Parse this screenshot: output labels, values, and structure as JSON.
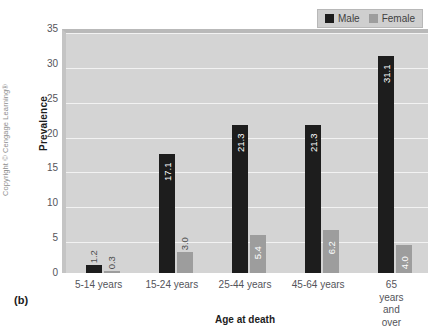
{
  "chart_data": {
    "type": "bar",
    "title": "",
    "xlabel": "Age at death",
    "ylabel": "Prevalence",
    "ylim": [
      0,
      35
    ],
    "yticks": [
      0,
      5,
      10,
      15,
      20,
      25,
      30,
      35
    ],
    "grid": true,
    "legend_position": "top-right",
    "categories": [
      "5-14 years",
      "15-24 years",
      "25-44 years",
      "45-64 years",
      "65 years\nand over"
    ],
    "series": [
      {
        "name": "Male",
        "color": "#1d1d1d",
        "values": [
          1.2,
          17.1,
          21.3,
          21.3,
          31.1
        ]
      },
      {
        "name": "Female",
        "color": "#9d9d9d",
        "values": [
          0.3,
          3.0,
          5.4,
          6.2,
          4.0
        ]
      }
    ]
  },
  "legend": {
    "entries": [
      {
        "label": "Male",
        "swatch": "black-square-swatch"
      },
      {
        "label": "Female",
        "swatch": "gray-square-swatch"
      }
    ]
  },
  "axes": {
    "y_title": "Prevalence",
    "x_title": "Age at death",
    "y_tick_labels": [
      "0",
      "5",
      "10",
      "15",
      "20",
      "25",
      "30",
      "35"
    ],
    "x_tick_labels": [
      "5-14 years",
      "15-24 years",
      "25-44 years",
      "45-64 years",
      "65 years\nand over"
    ]
  },
  "bar_value_labels": {
    "male": [
      "1.2",
      "17.1",
      "21.3",
      "21.3",
      "31.1"
    ],
    "female": [
      "0.3",
      "3.0",
      "5.4",
      "6.2",
      "4.0"
    ]
  },
  "annotations": {
    "panel_label": "(b)",
    "credit": "Copyright © Cengage Learning®"
  },
  "colors": {
    "male_bar": "#1d1d1d",
    "female_bar": "#9d9d9d",
    "plot_background": "#d4d4d4",
    "gridline": "#f2f2f2",
    "legend_background": "#cfcfcf"
  }
}
